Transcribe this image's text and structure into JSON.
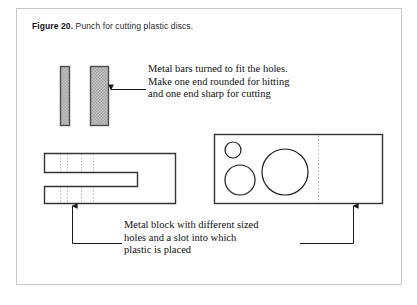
{
  "figure": {
    "caption_lead": "Figure 20.",
    "caption_text": " Punch for cutting plastic discs.",
    "border_color": "#c8c8c8",
    "background": "#ffffff"
  },
  "annotations": {
    "bars": {
      "lines": [
        "Metal bars turned to fit the holes.",
        "Make one end rounded for hitting",
        "and one end sharp for cutting"
      ]
    },
    "block": {
      "lines": [
        "Metal block with different sized",
        "holes and a slot into which",
        "plastic is placed"
      ]
    }
  },
  "parts": {
    "bar_narrow": {
      "label": "narrow-metal-bar",
      "fill": "#b3b3b3",
      "stroke": "#4d4d4d"
    },
    "bar_wide": {
      "label": "wide-metal-bar",
      "fill": "#b3b3b3",
      "stroke": "#4d4d4d"
    },
    "slot_block": {
      "label": "slotted-metal-block",
      "stroke": "#333333"
    },
    "hole_block": {
      "label": "holed-metal-block",
      "stroke": "#333333"
    },
    "holes": [
      {
        "name": "small-hole",
        "size": "small"
      },
      {
        "name": "medium-hole",
        "size": "medium"
      },
      {
        "name": "large-hole",
        "size": "large"
      }
    ]
  },
  "leaders": {
    "bars_arrow": "arrow-to-wide-bar",
    "block_bracket": "bracket-to-blocks"
  }
}
